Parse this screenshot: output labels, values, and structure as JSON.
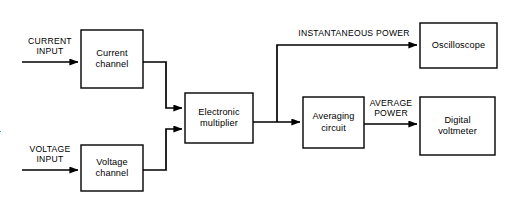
{
  "diagram": {
    "stroke_color": "#000000",
    "background_color": "#ffffff",
    "blocks": [
      {
        "id": "current-channel",
        "line1": "Current",
        "line2": "channel"
      },
      {
        "id": "voltage-channel",
        "line1": "Voltage",
        "line2": "channel"
      },
      {
        "id": "electronic-multiplier",
        "line1": "Electronic",
        "line2": "multiplier"
      },
      {
        "id": "averaging-circuit",
        "line1": "Averaging",
        "line2": "circuit"
      },
      {
        "id": "oscilloscope",
        "line1": "Oscilloscope",
        "line2": ""
      },
      {
        "id": "digital-voltmeter",
        "line1": "Digital",
        "line2": "voltmeter"
      }
    ],
    "signals": {
      "current_input_line1": "CURRENT",
      "current_input_line2": "INPUT",
      "voltage_input_line1": "VOLTAGE",
      "voltage_input_line2": "INPUT",
      "instantaneous_power": "INSTANTANEOUS POWER",
      "average_power_line1": "AVERAGE",
      "average_power_line2": "POWER"
    },
    "edge_fragment": "r"
  }
}
